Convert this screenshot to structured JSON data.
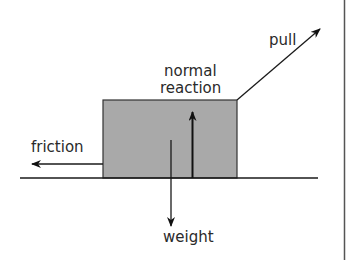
{
  "diagram": {
    "labels": {
      "pull": "pull",
      "normal_line1": "normal",
      "normal_line2": "reaction",
      "friction": "friction",
      "weight": "weight"
    },
    "colors": {
      "block_fill": "#a9a9a9",
      "stroke": "#1a1a1a",
      "text": "#2a2a2a"
    }
  }
}
